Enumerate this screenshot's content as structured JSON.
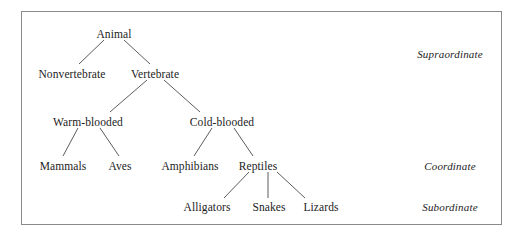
{
  "figure": {
    "type": "hierarchy-tree-diagram",
    "border_color": "#8a8a8a",
    "background_color": "#ffffff",
    "text_color": "#1c1c1c"
  },
  "nodes": [
    {
      "id": "animal",
      "label": "Animal",
      "level": "superordinate",
      "cx": 114,
      "cy": 34
    },
    {
      "id": "nonvertebrate",
      "label": "Nonvertebrate",
      "level": "level2",
      "cx": 72,
      "cy": 74
    },
    {
      "id": "vertebrate",
      "label": "Vertebrate",
      "level": "level2",
      "cx": 155,
      "cy": 74
    },
    {
      "id": "warm-blooded",
      "label": "Warm-blooded",
      "level": "level3",
      "cx": 88,
      "cy": 122
    },
    {
      "id": "cold-blooded",
      "label": "Cold-blooded",
      "level": "level3",
      "cx": 222,
      "cy": 122
    },
    {
      "id": "mammals",
      "label": "Mammals",
      "level": "coordinate",
      "cx": 63,
      "cy": 166
    },
    {
      "id": "aves",
      "label": "Aves",
      "level": "coordinate",
      "cx": 120,
      "cy": 166
    },
    {
      "id": "amphibians",
      "label": "Amphibians",
      "level": "coordinate",
      "cx": 190,
      "cy": 166
    },
    {
      "id": "reptiles",
      "label": "Reptiles",
      "level": "coordinate",
      "cx": 258,
      "cy": 166
    },
    {
      "id": "alligators",
      "label": "Alligators",
      "level": "subordinate",
      "cx": 207,
      "cy": 207
    },
    {
      "id": "snakes",
      "label": "Snakes",
      "level": "subordinate",
      "cx": 269,
      "cy": 207
    },
    {
      "id": "lizards",
      "label": "Lizards",
      "level": "subordinate",
      "cx": 321,
      "cy": 207
    }
  ],
  "edges": [
    {
      "from": "animal",
      "to": "nonvertebrate",
      "x1": 104,
      "y1": 40,
      "x2": 79,
      "y2": 64
    },
    {
      "from": "animal",
      "to": "vertebrate",
      "x1": 124,
      "y1": 40,
      "x2": 150,
      "y2": 64
    },
    {
      "from": "vertebrate",
      "to": "warm-blooded",
      "x1": 147,
      "y1": 80,
      "x2": 110,
      "y2": 112
    },
    {
      "from": "vertebrate",
      "to": "cold-blooded",
      "x1": 164,
      "y1": 80,
      "x2": 200,
      "y2": 112
    },
    {
      "from": "warm-blooded",
      "to": "mammals",
      "x1": 78,
      "y1": 128,
      "x2": 63,
      "y2": 156
    },
    {
      "from": "warm-blooded",
      "to": "aves",
      "x1": 100,
      "y1": 128,
      "x2": 119,
      "y2": 156
    },
    {
      "from": "cold-blooded",
      "to": "amphibians",
      "x1": 212,
      "y1": 128,
      "x2": 194,
      "y2": 156
    },
    {
      "from": "cold-blooded",
      "to": "reptiles",
      "x1": 234,
      "y1": 128,
      "x2": 253,
      "y2": 156
    },
    {
      "from": "reptiles",
      "to": "alligators",
      "x1": 249,
      "y1": 172,
      "x2": 224,
      "y2": 198
    },
    {
      "from": "reptiles",
      "to": "snakes",
      "x1": 268,
      "y1": 172,
      "x2": 268,
      "y2": 198
    },
    {
      "from": "reptiles",
      "to": "lizards",
      "x1": 277,
      "y1": 172,
      "x2": 305,
      "y2": 198
    }
  ],
  "level_labels": [
    {
      "id": "supraordinate",
      "label": "Supraordinate",
      "cx": 450,
      "cy": 54
    },
    {
      "id": "coordinate",
      "label": "Coordinate",
      "cx": 450,
      "cy": 166
    },
    {
      "id": "subordinate",
      "label": "Subordinate",
      "cx": 450,
      "cy": 207
    }
  ]
}
